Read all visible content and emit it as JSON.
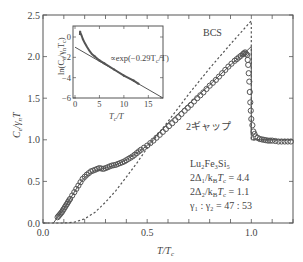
{
  "chart_data": [
    {
      "type": "line",
      "title": "",
      "xlabel": "T/Tc",
      "ylabel": "Ce/γnT",
      "xlim": [
        0.0,
        1.2
      ],
      "ylim": [
        0.0,
        2.5
      ],
      "xticks": [
        "0.0",
        "0.5",
        "1.0"
      ],
      "yticks": [
        "0.0",
        "0.5",
        "1.0",
        "1.5",
        "2.0",
        "2.5"
      ],
      "grid": false,
      "annotations": [
        "BCS",
        "2ギャップ",
        "Lu2Fe3Si5",
        "2Δ1/kBTc = 4.4",
        "2Δ2/kBTc = 1.1",
        "γ1 : γ2 = 47 : 53"
      ],
      "series": [
        {
          "name": "data (open circles)",
          "style": "markers",
          "x": [
            0.07,
            0.08,
            0.09,
            0.1,
            0.11,
            0.12,
            0.13,
            0.15,
            0.17,
            0.19,
            0.21,
            0.23,
            0.25,
            0.27,
            0.29,
            0.31,
            0.33,
            0.35,
            0.37,
            0.39,
            0.41,
            0.43,
            0.45,
            0.47,
            0.5,
            0.53,
            0.56,
            0.59,
            0.62,
            0.65,
            0.68,
            0.71,
            0.74,
            0.77,
            0.8,
            0.83,
            0.86,
            0.89,
            0.92,
            0.94,
            0.96,
            0.97,
            0.98,
            0.985,
            0.99,
            0.995,
            1.0,
            1.01,
            1.02,
            1.04,
            1.06,
            1.08,
            1.1,
            1.13,
            1.16,
            1.19
          ],
          "y": [
            0.07,
            0.1,
            0.13,
            0.17,
            0.21,
            0.25,
            0.29,
            0.37,
            0.45,
            0.53,
            0.58,
            0.62,
            0.64,
            0.66,
            0.65,
            0.67,
            0.69,
            0.7,
            0.72,
            0.74,
            0.77,
            0.8,
            0.84,
            0.88,
            0.93,
            0.99,
            1.06,
            1.13,
            1.2,
            1.27,
            1.35,
            1.42,
            1.5,
            1.57,
            1.65,
            1.72,
            1.8,
            1.88,
            1.95,
            1.99,
            2.03,
            2.05,
            2.02,
            1.9,
            1.7,
            1.45,
            1.25,
            1.1,
            1.04,
            1.01,
            1.0,
            0.99,
            0.99,
            0.98,
            0.98,
            0.98
          ]
        },
        {
          "name": "2ギャップ",
          "style": "solid",
          "x": [
            0.05,
            0.07,
            0.1,
            0.13,
            0.16,
            0.19,
            0.22,
            0.25,
            0.3,
            0.35,
            0.4,
            0.45,
            0.5,
            0.6,
            0.7,
            0.8,
            0.9,
            0.97,
            1.0,
            1.0,
            1.2
          ],
          "y": [
            0.0,
            0.07,
            0.17,
            0.29,
            0.41,
            0.52,
            0.59,
            0.63,
            0.66,
            0.7,
            0.76,
            0.84,
            0.93,
            1.2,
            1.43,
            1.66,
            1.9,
            2.05,
            2.12,
            1.0,
            1.0
          ]
        },
        {
          "name": "BCS",
          "style": "dashed",
          "x": [
            0.0,
            0.1,
            0.15,
            0.2,
            0.25,
            0.3,
            0.35,
            0.4,
            0.45,
            0.5,
            0.6,
            0.7,
            0.8,
            0.9,
            1.0,
            1.0,
            1.2
          ],
          "y": [
            0.0,
            0.0,
            0.01,
            0.05,
            0.13,
            0.25,
            0.39,
            0.55,
            0.72,
            0.9,
            1.22,
            1.55,
            1.86,
            2.15,
            2.43,
            1.0,
            1.0
          ]
        }
      ]
    },
    {
      "type": "line",
      "title": "inset",
      "xlabel": "Tc/T",
      "ylabel": "ln(Ce/γnTc)",
      "xlim": [
        0,
        18
      ],
      "ylim": [
        -6,
        1
      ],
      "xticks": [
        "0",
        "5",
        "10",
        "15"
      ],
      "yticks": [
        "0",
        "-2",
        "-4",
        "-6"
      ],
      "annotations": [
        "∝exp(−0.29Tc/T)"
      ],
      "series": [
        {
          "name": "data",
          "style": "markers",
          "x": [
            1.0,
            1.05,
            1.1,
            1.2,
            1.4,
            1.6,
            2.0,
            2.5,
            3.0,
            3.5,
            4.0,
            5.0,
            6.0,
            8.0,
            10.0,
            12.0,
            13.0
          ],
          "y": [
            0.2,
            0.6,
            0.4,
            0.3,
            0.1,
            -0.2,
            -0.6,
            -1.0,
            -1.4,
            -1.7,
            -1.9,
            -2.3,
            -2.6,
            -3.2,
            -3.8,
            -4.3,
            -4.6
          ]
        },
        {
          "name": "∝exp(−0.29Tc/T)",
          "style": "solid",
          "x": [
            0,
            18
          ],
          "y": [
            -1.0,
            -6.1
          ]
        }
      ]
    }
  ],
  "labels": {
    "y_axis": "C",
    "y_axis_sub": "e",
    "y_axis_mid": "/γ",
    "y_axis_sub2": "n",
    "y_axis_end": "T",
    "x_axis": "T/T",
    "x_axis_sub": "c",
    "bcs": "BCS",
    "two_gap": "2ギャップ",
    "compound": "Lu₂Fe₃Si₅",
    "gap1": "2Δ₁/k",
    "gap1_b": "B",
    "gap1_end": "T",
    "gap1_c": "c",
    "gap1_val": " = 4.4",
    "gap2": "2Δ₂/k",
    "gap2_val": " = 1.1",
    "ratio": "γ₁ : γ₂ = 47 : 53",
    "inset_fit": "∝exp(−0.29T",
    "inset_fit_end": "/T)",
    "inset_y": "ln(C",
    "inset_y_mid": "/γ",
    "inset_y_end": "T",
    "inset_x": "T",
    "inset_x_end": "/T"
  },
  "ticks": {
    "x": [
      {
        "v": 0.0,
        "label": "0.0"
      },
      {
        "v": 0.5,
        "label": "0.5"
      },
      {
        "v": 1.0,
        "label": "1.0"
      }
    ],
    "y": [
      {
        "v": 0.0,
        "label": "0.0"
      },
      {
        "v": 0.5,
        "label": "0.5"
      },
      {
        "v": 1.0,
        "label": "1.0"
      },
      {
        "v": 1.5,
        "label": "1.5"
      },
      {
        "v": 2.0,
        "label": "2.0"
      },
      {
        "v": 2.5,
        "label": "2.5"
      }
    ],
    "inset_x": [
      {
        "v": 0,
        "label": "0"
      },
      {
        "v": 5,
        "label": "5"
      },
      {
        "v": 10,
        "label": "10"
      },
      {
        "v": 15,
        "label": "15"
      }
    ],
    "inset_y": [
      {
        "v": 0,
        "label": "0"
      },
      {
        "v": -2,
        "label": "−2"
      },
      {
        "v": -4,
        "label": "−4"
      },
      {
        "v": -6,
        "label": "−6"
      }
    ]
  },
  "colors": {
    "axis": "#555555",
    "data": "#555555",
    "text": "#444444"
  }
}
